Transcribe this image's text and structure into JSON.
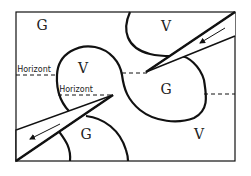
{
  "diagram": {
    "colors": {
      "stroke": "#111111",
      "background": "#ffffff"
    },
    "regions": [
      {
        "id": "g-top-left",
        "label": "G",
        "x": 42,
        "y": 30
      },
      {
        "id": "v-top-right",
        "label": "V",
        "x": 166,
        "y": 31
      },
      {
        "id": "v-center-left",
        "label": "V",
        "x": 83,
        "y": 73
      },
      {
        "id": "g-center-right",
        "label": "G",
        "x": 166,
        "y": 94
      },
      {
        "id": "g-bottom-left",
        "label": "G",
        "x": 86,
        "y": 139
      },
      {
        "id": "v-bottom-right",
        "label": "V",
        "x": 199,
        "y": 139
      }
    ],
    "horizons": [
      {
        "id": "horizon-upper",
        "label": "Horizont",
        "label_x": 19,
        "label_y": 71
      },
      {
        "id": "horizon-lower",
        "label": "Horizont",
        "label_x": 62,
        "label_y": 92
      }
    ]
  }
}
